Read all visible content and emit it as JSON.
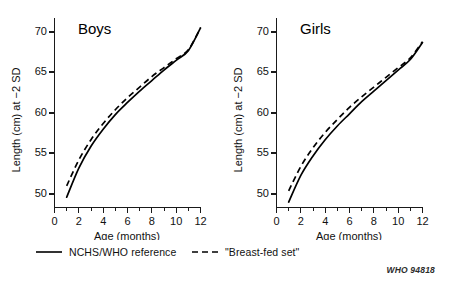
{
  "figure": {
    "source_code": "WHO 94818"
  },
  "legend": {
    "entries": [
      {
        "label": "NCHS/WHO reference",
        "style": "solid",
        "color": "#000000"
      },
      {
        "label": "\"Breast-fed set\"",
        "style": "dashed",
        "color": "#000000"
      }
    ]
  },
  "chart_data": [
    {
      "type": "line",
      "title": "Boys",
      "xlabel": "Age (months)",
      "ylabel": "Length (cm) at −2 SD",
      "xlim": [
        0,
        12
      ],
      "ylim": [
        48,
        71.5
      ],
      "xticks": [
        0,
        2,
        4,
        6,
        8,
        10,
        12
      ],
      "xticklabels": [
        "0",
        "2",
        "4",
        "6",
        "8",
        "10",
        "12"
      ],
      "xminorticks": [
        1,
        3,
        5,
        7,
        9,
        11
      ],
      "yticks": [
        50,
        55,
        60,
        65,
        70
      ],
      "yticklabels": [
        "50",
        "55",
        "60",
        "65",
        "70"
      ],
      "grid": false,
      "legend_position": "below-figure",
      "x": [
        1,
        2,
        3,
        4,
        5,
        6,
        7,
        8,
        9,
        10,
        11,
        12
      ],
      "series": [
        {
          "name": "NCHS/WHO reference",
          "style": "solid",
          "values": [
            49.6,
            53.2,
            55.9,
            58.0,
            59.8,
            61.3,
            62.7,
            64.0,
            65.3,
            66.5,
            67.7,
            70.5
          ]
        },
        {
          "name": "\"Breast-fed set\"",
          "style": "dashed",
          "values": [
            51.0,
            54.2,
            56.7,
            58.7,
            60.4,
            61.9,
            63.2,
            64.5,
            65.6,
            66.7,
            67.8,
            70.5
          ]
        }
      ]
    },
    {
      "type": "line",
      "title": "Girls",
      "xlabel": "Age (months)",
      "ylabel": "Length (cm) at −2 SD",
      "xlim": [
        0,
        12
      ],
      "ylim": [
        48,
        71.5
      ],
      "xticks": [
        0,
        2,
        4,
        6,
        8,
        10,
        12
      ],
      "xticklabels": [
        "0",
        "2",
        "4",
        "6",
        "8",
        "10",
        "12"
      ],
      "xminorticks": [
        1,
        3,
        5,
        7,
        9,
        11
      ],
      "yticks": [
        50,
        55,
        60,
        65,
        70
      ],
      "yticklabels": [
        "50",
        "55",
        "60",
        "65",
        "70"
      ],
      "grid": false,
      "legend_position": "below-figure",
      "x": [
        1,
        2,
        3,
        4,
        5,
        6,
        7,
        8,
        9,
        10,
        11,
        12
      ],
      "series": [
        {
          "name": "NCHS/WHO reference",
          "style": "solid",
          "values": [
            49.0,
            52.3,
            54.7,
            56.7,
            58.4,
            59.9,
            61.4,
            62.7,
            64.0,
            65.3,
            66.6,
            68.7
          ]
        },
        {
          "name": "\"Breast-fed set\"",
          "style": "dashed",
          "values": [
            50.4,
            53.4,
            55.7,
            57.6,
            59.2,
            60.7,
            62.0,
            63.2,
            64.4,
            65.6,
            66.8,
            68.8
          ]
        }
      ]
    }
  ]
}
